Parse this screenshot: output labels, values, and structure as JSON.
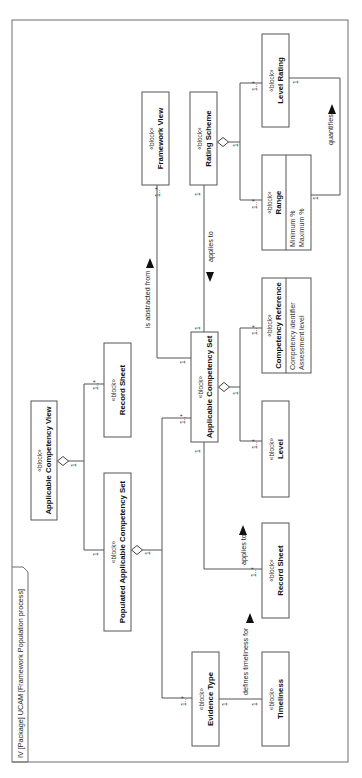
{
  "diagram": {
    "title": "IV [Package] UCAM [Framework Population process]",
    "frame": {
      "x": 12,
      "y": 20,
      "w": 336,
      "h": 742
    },
    "title_tab": {
      "x": 12,
      "y": 567,
      "w": 16,
      "h": 195
    },
    "colors": {
      "line": "#555555",
      "frame": "#6e6e6e",
      "text": "#111111",
      "background": "#ffffff"
    },
    "stereotype": "«block»",
    "blocks": [
      {
        "id": "applicable-competency-view",
        "name": "Applicable Competency View",
        "x": 31,
        "y": 401,
        "w": 26,
        "h": 119,
        "attributes": []
      },
      {
        "id": "record-sheet-top",
        "name": "Record Sheet",
        "x": 104,
        "y": 343,
        "w": 27,
        "h": 94,
        "attributes": []
      },
      {
        "id": "populated-applicable-competency-set",
        "name": "Populated Applicable Competency Set",
        "x": 104,
        "y": 473,
        "w": 27,
        "h": 158,
        "attributes": []
      },
      {
        "id": "framework-view",
        "name": "Framework View",
        "x": 142,
        "y": 92,
        "w": 27,
        "h": 93,
        "attributes": []
      },
      {
        "id": "rating-scheme",
        "name": "Rating Scheme",
        "x": 190,
        "y": 92,
        "w": 27,
        "h": 93,
        "attributes": []
      },
      {
        "id": "applicable-competency-set",
        "name": "Applicable Competency Set",
        "x": 191,
        "y": 332,
        "w": 27,
        "h": 110,
        "attributes": []
      },
      {
        "id": "level-rating",
        "name": "Level Rating",
        "x": 262,
        "y": 34,
        "w": 27,
        "h": 93,
        "attributes": []
      },
      {
        "id": "range",
        "name": "Range",
        "x": 262,
        "y": 155,
        "w": 49,
        "h": 95,
        "divider": 286,
        "attributes": [
          "Minimum %",
          "Maximum %"
        ]
      },
      {
        "id": "competency-reference",
        "name": "Competency Reference",
        "x": 262,
        "y": 278,
        "w": 49,
        "h": 95,
        "divider": 286,
        "attributes": [
          "Competency identifier",
          "Assessment level"
        ]
      },
      {
        "id": "level",
        "name": "Level",
        "x": 262,
        "y": 401,
        "w": 27,
        "h": 96,
        "attributes": []
      },
      {
        "id": "record-sheet-bottom",
        "name": "Record Sheet",
        "x": 262,
        "y": 523,
        "w": 27,
        "h": 95,
        "attributes": []
      },
      {
        "id": "evidence-type",
        "name": "Evidence Type",
        "x": 192,
        "y": 652,
        "w": 27,
        "h": 94,
        "attributes": []
      },
      {
        "id": "timeliness",
        "name": "Timeliness",
        "x": 262,
        "y": 652,
        "w": 27,
        "h": 94,
        "attributes": []
      }
    ],
    "connectors": [
      {
        "id": "acv-to-record-sheet",
        "points": [
          [
            68,
            461
          ],
          [
            84,
            461
          ],
          [
            84,
            384
          ],
          [
            104,
            384
          ]
        ]
      },
      {
        "id": "acv-to-populated-acs",
        "points": [
          [
            84,
            461
          ],
          [
            84,
            550
          ],
          [
            104,
            550
          ]
        ]
      },
      {
        "id": "populated-acs-to-acs",
        "points": [
          [
            142,
            550
          ],
          [
            162,
            550
          ],
          [
            162,
            418
          ],
          [
            191,
            418
          ]
        ]
      },
      {
        "id": "populated-acs-to-evidence-type",
        "points": [
          [
            162,
            550
          ],
          [
            162,
            698
          ],
          [
            192,
            698
          ]
        ]
      },
      {
        "id": "acs-to-framework-view",
        "points": [
          [
            191,
            358
          ],
          [
            157,
            358
          ],
          [
            157,
            185
          ]
        ]
      },
      {
        "id": "acs-to-rating-scheme",
        "points": [
          [
            204,
            332
          ],
          [
            204,
            185
          ]
        ]
      },
      {
        "id": "acs-to-record-sheet-bottom",
        "points": [
          [
            204,
            442
          ],
          [
            204,
            569
          ],
          [
            262,
            569
          ]
        ]
      },
      {
        "id": "acs-to-competency-reference",
        "points": [
          [
            229,
            387
          ],
          [
            240,
            387
          ],
          [
            240,
            328
          ],
          [
            262,
            328
          ]
        ]
      },
      {
        "id": "acs-to-level",
        "points": [
          [
            240,
            387
          ],
          [
            240,
            441
          ],
          [
            262,
            441
          ]
        ]
      },
      {
        "id": "rating-scheme-to-level-rating",
        "points": [
          [
            228,
            142
          ],
          [
            240,
            142
          ],
          [
            240,
            83
          ],
          [
            262,
            83
          ]
        ]
      },
      {
        "id": "rating-scheme-to-range",
        "points": [
          [
            240,
            142
          ],
          [
            240,
            200
          ],
          [
            262,
            200
          ]
        ]
      },
      {
        "id": "range-to-level-rating",
        "points": [
          [
            311,
            195
          ],
          [
            340,
            195
          ],
          [
            340,
            78
          ],
          [
            289,
            78
          ]
        ]
      },
      {
        "id": "evidence-type-to-timeliness",
        "points": [
          [
            219,
            699
          ],
          [
            262,
            699
          ]
        ]
      }
    ],
    "diamonds": [
      {
        "id": "acv-diamond",
        "cx": 63,
        "cy": 461
      },
      {
        "id": "populated-acs-diamond",
        "cx": 137,
        "cy": 550
      },
      {
        "id": "acs-diamond",
        "cx": 224,
        "cy": 387
      },
      {
        "id": "rating-scheme-diamond",
        "cx": 223,
        "cy": 142
      }
    ],
    "multiplicities": [
      {
        "text": "1",
        "x": 76,
        "y": 467
      },
      {
        "text": "1..*",
        "x": 98,
        "y": 390
      },
      {
        "text": "1",
        "x": 98,
        "y": 556
      },
      {
        "text": "1",
        "x": 150,
        "y": 555
      },
      {
        "text": "1..*",
        "x": 185,
        "y": 424
      },
      {
        "text": "1..*",
        "x": 186,
        "y": 706
      },
      {
        "text": "1..*",
        "x": 160,
        "y": 197
      },
      {
        "text": "1",
        "x": 185,
        "y": 364
      },
      {
        "text": "1",
        "x": 200,
        "y": 196
      },
      {
        "text": "1",
        "x": 200,
        "y": 330
      },
      {
        "text": "1",
        "x": 200,
        "y": 453
      },
      {
        "text": "1..*",
        "x": 256,
        "y": 577
      },
      {
        "text": "1",
        "x": 238,
        "y": 395
      },
      {
        "text": "1..*",
        "x": 257,
        "y": 335
      },
      {
        "text": "1..*",
        "x": 257,
        "y": 449
      },
      {
        "text": "1",
        "x": 238,
        "y": 147
      },
      {
        "text": "1..*",
        "x": 257,
        "y": 91
      },
      {
        "text": "1..*",
        "x": 257,
        "y": 209
      },
      {
        "text": "1",
        "x": 318,
        "y": 200
      },
      {
        "text": "1",
        "x": 298,
        "y": 84
      },
      {
        "text": "1",
        "x": 227,
        "y": 706
      },
      {
        "text": "1",
        "x": 257,
        "y": 706
      }
    ],
    "labels": [
      {
        "id": "is-abstracted-from",
        "text": "is abstracted from",
        "x": 150,
        "y": 328,
        "arrow": {
          "x": 150,
          "y": 263,
          "dir": "up"
        }
      },
      {
        "id": "applies-to-rating",
        "text": "applies to",
        "x": 213,
        "y": 262,
        "arrow": {
          "x": 210,
          "y": 277,
          "dir": "down"
        }
      },
      {
        "id": "applies-to-record-sheet",
        "text": "applies to",
        "x": 246,
        "y": 565,
        "arrow": {
          "x": 243,
          "y": 530,
          "dir": "up"
        }
      },
      {
        "id": "defines-timeliness-for",
        "text": "defines timeliness for",
        "x": 248,
        "y": 695,
        "arrow": {
          "x": 250,
          "y": 618,
          "dir": "up"
        }
      },
      {
        "id": "quantifies",
        "text": "quantifies",
        "x": 333,
        "y": 145,
        "arrow": {
          "x": 332,
          "y": 109,
          "dir": "up"
        }
      }
    ]
  }
}
